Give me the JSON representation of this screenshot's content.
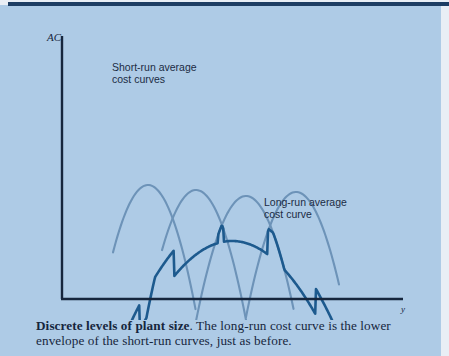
{
  "figure": {
    "axis_y_label": "AC",
    "axis_x_label": "y",
    "annotation_srac_line1": "Short-run average",
    "annotation_srac_line2": "cost curves",
    "annotation_lrac_line1": "Long-run average",
    "annotation_lrac_line2": "cost curve"
  },
  "caption": {
    "title": "Discrete levels of plant size",
    "body": ". The long-run cost curve is the lower envelope of the short-run curves, just as before."
  },
  "colors": {
    "panel_background": "#aecbe6",
    "paper_background": "#e9eef5",
    "axis": "#16263d",
    "top_rule": "#1d3d63",
    "long_run_curve": "#1d5a8e",
    "short_run_curve": "#6d93b8",
    "caption_text": "#16263d"
  },
  "chart_data": {
    "type": "line",
    "title": "Discrete levels of plant size",
    "xlabel": "y",
    "ylabel": "AC",
    "grid": false,
    "legend": "annotations",
    "axis": {
      "origin": [
        62,
        299
      ],
      "y_axis_top": [
        62,
        36
      ],
      "x_axis_right": [
        403,
        299
      ]
    },
    "series": [
      {
        "name": "Short-run average cost curve 1",
        "role": "short-run",
        "color": "#6d93b8",
        "vertex": [
          148,
          185
        ],
        "curvature": 0.055,
        "x_start": 113,
        "x_end": 196,
        "y_start": 95,
        "y_end": 172
      },
      {
        "name": "Short-run average cost curve 2",
        "role": "short-run",
        "color": "#6d93b8",
        "vertex": [
          196,
          190
        ],
        "curvature": 0.052,
        "x_start": 162,
        "x_end": 246,
        "y_start": 130,
        "y_end": 82
      },
      {
        "name": "Short-run average cost curve 3",
        "role": "short-run",
        "color": "#6d93b8",
        "vertex": [
          246,
          196
        ],
        "curvature": 0.05,
        "x_start": 196,
        "x_end": 294,
        "y_start": 82,
        "y_end": 92
      },
      {
        "name": "Short-run average cost curve 4",
        "role": "short-run",
        "color": "#6d93b8",
        "vertex": [
          296,
          192
        ],
        "curvature": 0.05,
        "x_start": 246,
        "x_end": 340,
        "y_start": 92,
        "y_end": 109
      },
      {
        "name": "Long-run average cost curve",
        "role": "long-run",
        "color": "#1d5a8e",
        "vertex": [
          232,
          215
        ],
        "curvature": 0.0105,
        "x_start": 88,
        "x_end": 371,
        "y_start": 75,
        "y_end": 89,
        "scalloped": true
      }
    ],
    "annotations": [
      {
        "text": "Short-run average cost curves",
        "x": 112,
        "y": 68
      },
      {
        "text": "Long-run average cost curve",
        "x": 264,
        "y": 203
      }
    ]
  }
}
